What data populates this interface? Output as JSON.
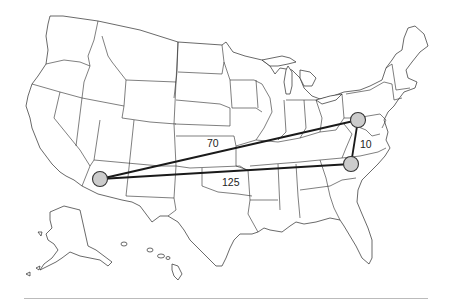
{
  "map": {
    "title": "",
    "background": "#ffffff",
    "border_color": "#2a2a2a",
    "point_fill": "#cccccc",
    "point_stroke": "#333333",
    "route_color": "#1a1a1a",
    "rule_color": "#bbbbbb"
  },
  "points": [
    {
      "id": "arizona",
      "cx": 100,
      "cy": 179,
      "r": 7.5
    },
    {
      "id": "pennsylvania",
      "cx": 358,
      "cy": 120,
      "r": 7.5
    },
    {
      "id": "north-carolina",
      "cx": 351,
      "cy": 164,
      "r": 7.5
    }
  ],
  "routes": [
    {
      "from": "arizona",
      "to": "pennsylvania",
      "label": "70",
      "label_x": 207,
      "label_y": 138
    },
    {
      "from": "arizona",
      "to": "north-carolina",
      "label": "125",
      "label_x": 222,
      "label_y": 177
    },
    {
      "from": "pennsylvania",
      "to": "north-carolina",
      "label": "10",
      "label_x": 359,
      "label_y": 139
    }
  ],
  "labels": {
    "route_ap": "70",
    "route_an": "125",
    "route_pn": "10"
  }
}
